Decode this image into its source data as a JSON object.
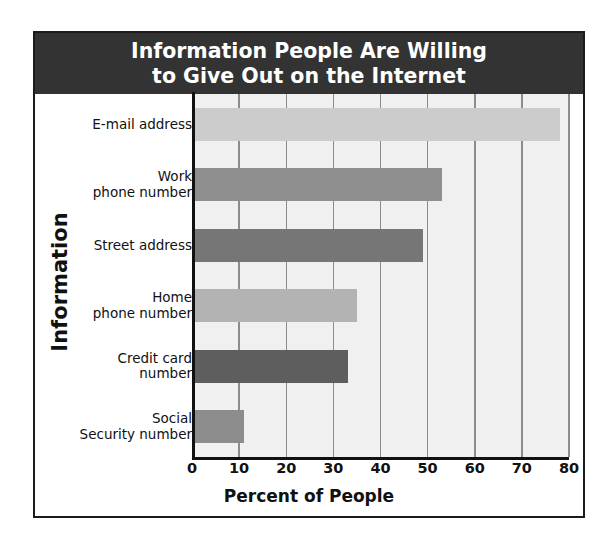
{
  "chart_data": {
    "type": "bar",
    "orientation": "horizontal",
    "title": "Information People Are Willing to Give Out on the Internet",
    "title_lines": [
      "Information People Are Willing",
      "to Give Out on the Internet"
    ],
    "xlabel": "Percent of People",
    "ylabel": "Information",
    "categories": [
      "E-mail address",
      "Work phone number",
      "Street address",
      "Home phone number",
      "Credit card number",
      "Social Security number"
    ],
    "category_lines": [
      [
        "E-mail address"
      ],
      [
        "Work",
        "phone number"
      ],
      [
        "Street address"
      ],
      [
        "Home",
        "phone number"
      ],
      [
        "Credit card",
        "number"
      ],
      [
        "Social",
        "Security number"
      ]
    ],
    "values": [
      78,
      53,
      49,
      35,
      33,
      11
    ],
    "bar_colors": [
      "#cccccc",
      "#8f8f8f",
      "#767676",
      "#b3b3b3",
      "#5e5e5e",
      "#8c8c8c"
    ],
    "xlim": [
      0,
      80
    ],
    "xticks": [
      0,
      10,
      20,
      30,
      40,
      50,
      60,
      70,
      80
    ],
    "xtick_labels": [
      "0",
      "10",
      "20",
      "30",
      "40",
      "50",
      "60",
      "70",
      "80"
    ],
    "grid": "vertical",
    "legend": "none",
    "plot_background": "#f0f0f0",
    "title_background": "#333333",
    "title_color": "#ffffff"
  }
}
